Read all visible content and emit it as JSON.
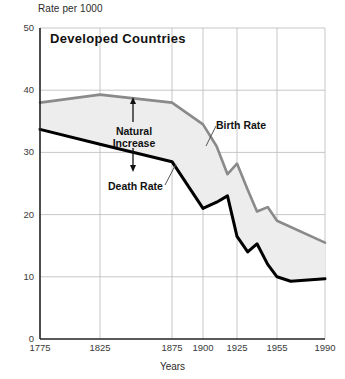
{
  "chart_data": {
    "type": "line",
    "title": "Developed Countries",
    "ylabel": "Rate per 1000",
    "xlabel": "Years",
    "ylim": [
      0,
      50
    ],
    "yticks": [
      0,
      10,
      20,
      30,
      40,
      50
    ],
    "xticks": [
      "1775",
      "1825",
      "1875",
      "1900",
      "1925",
      "1955",
      "1990"
    ],
    "grid": true,
    "legend_position": "inline-annotations",
    "annotations": [
      {
        "name": "natural-increase",
        "text_line1": "Natural",
        "text_line2": "Increase"
      },
      {
        "name": "birth-rate-callout",
        "text": "Birth Rate"
      },
      {
        "name": "death-rate-callout",
        "text": "Death Rate"
      }
    ],
    "series": [
      {
        "name": "Birth Rate",
        "color": "#8a8a8a",
        "x": [
          1775,
          1825,
          1875,
          1900,
          1910,
          1918,
          1925,
          1933,
          1940,
          1948,
          1955,
          1990
        ],
        "values": [
          38.0,
          39.3,
          38.0,
          34.5,
          31.0,
          26.5,
          28.2,
          24.0,
          20.5,
          21.2,
          19.0,
          15.5
        ]
      },
      {
        "name": "Death Rate",
        "color": "#000000",
        "x": [
          1775,
          1825,
          1875,
          1900,
          1910,
          1918,
          1925,
          1933,
          1940,
          1948,
          1955,
          1965,
          1990
        ],
        "values": [
          33.7,
          31.3,
          28.5,
          21.0,
          22.0,
          23.0,
          16.5,
          14.0,
          15.3,
          12.0,
          10.0,
          9.3,
          9.7
        ]
      }
    ],
    "shaded_region": {
      "name": "Natural Increase",
      "fill": "#ededed",
      "between": [
        "Birth Rate",
        "Death Rate"
      ]
    }
  },
  "axes": {
    "y_axis_caption": "Rate per 1000",
    "x_axis_caption": "Years"
  }
}
